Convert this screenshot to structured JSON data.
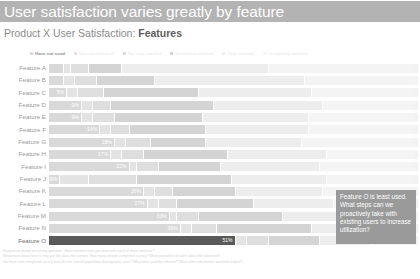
{
  "header": {
    "banner_title": "User satisfaction varies greatly by feature",
    "banner_color": "#b3b3b3",
    "subtitle_prefix": "Product X User Satisfaction: ",
    "subtitle_emphasis": "Features"
  },
  "callout": {
    "text": "Feature O is least used. What steps can we proactively take with existing users to increase utilization?",
    "background": "#9a9a9a",
    "text_color": "#ffffff"
  },
  "footnote": {
    "line1": "Responses based on survey question: \"How satisfied have you been with each of these features?\"",
    "line2": "Need more detail here to help put this data into context. How many people completed survey? What proportion of users does this represent?",
    "line3": "Do those who completed survey look like the overall population demographic-wise? What else could be relevant? What other information would be helpful?"
  },
  "chart_data": {
    "type": "bar",
    "title": "Product X User Satisfaction: Features",
    "xlabel": "",
    "ylabel": "",
    "xlim": [
      0,
      100
    ],
    "grid": false,
    "legend_position": "top",
    "stacked": true,
    "orientation": "horizontal",
    "categories": [
      "Feature A",
      "Feature B",
      "Feature C",
      "Feature D",
      "Feature E",
      "Feature F",
      "Feature G",
      "Feature H",
      "Feature I",
      "Feature J",
      "Feature K",
      "Feature L",
      "Feature M",
      "Feature N",
      "Feature O"
    ],
    "series": [
      {
        "name": "Have not used",
        "color": "#d9d9d9",
        "label_color": "#ffffff",
        "values": [
          4,
          4,
          5,
          9,
          9,
          14,
          18,
          17,
          22,
          3,
          26,
          27,
          33,
          36,
          51
        ],
        "labels": [
          "",
          "",
          "5%",
          "9%",
          "9%",
          "14%",
          "18%",
          "17%",
          "22%",
          "3%",
          "26%",
          "27%",
          "33%",
          "36%",
          "51%"
        ]
      },
      {
        "name": "Not satisfied at all",
        "color": "#e3e3e3",
        "label_color": "#ffffff",
        "values": [
          2,
          3,
          3,
          3,
          3,
          3,
          3,
          3,
          2,
          8,
          3,
          3,
          2,
          3,
          3
        ],
        "labels": [
          "",
          "",
          "",
          "",
          "",
          "",
          "",
          "",
          "",
          "",
          "",
          "",
          "",
          "",
          ""
        ]
      },
      {
        "name": "Not very satisfied",
        "color": "#dedede",
        "label_color": "#ffffff",
        "values": [
          5,
          6,
          7,
          5,
          6,
          5,
          7,
          6,
          6,
          13,
          5,
          5,
          6,
          7,
          6
        ],
        "labels": [
          "",
          "",
          "",
          "",
          "",
          "",
          "",
          "",
          "",
          "",
          "",
          "",
          "",
          "",
          ""
        ]
      },
      {
        "name": "Somewhat satisfied",
        "color": "#d4d4d4",
        "label_color": "#ffffff",
        "values": [
          9,
          16,
          26,
          28,
          24,
          21,
          15,
          23,
          17,
          26,
          17,
          21,
          23,
          26,
          14
        ],
        "labels": [
          "",
          "",
          "",
          "",
          "",
          "",
          "",
          "",
          "",
          "",
          "",
          "",
          "",
          "",
          ""
        ]
      },
      {
        "name": "Very satisfied",
        "color": "#ededed",
        "label_color": "#ffffff",
        "values": [
          40,
          41,
          31,
          30,
          29,
          28,
          26,
          27,
          27,
          26,
          24,
          22,
          20,
          16,
          14
        ],
        "labels": [
          "",
          "",
          "",
          "",
          "",
          "",
          "",
          "",
          "",
          "",
          "",
          "",
          "",
          "",
          ""
        ]
      },
      {
        "name": "Completely satisfied",
        "color": "#f4f4f4",
        "label_color": "#ffffff",
        "values": [
          40,
          30,
          28,
          25,
          29,
          29,
          31,
          24,
          26,
          24,
          25,
          22,
          16,
          12,
          12
        ],
        "labels": [
          "",
          "",
          "",
          "",
          "",
          "",
          "",
          "",
          "",
          "",
          "",
          "",
          "",
          "",
          ""
        ]
      }
    ],
    "highlight_category": "Feature O",
    "highlight_color": "#595959"
  }
}
